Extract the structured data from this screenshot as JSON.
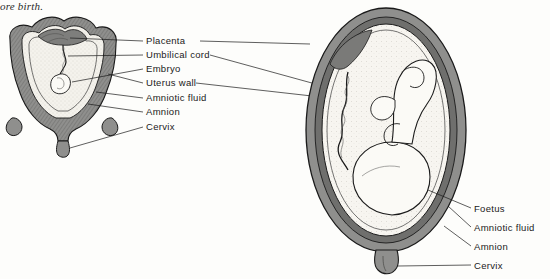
{
  "caption": {
    "text": "ore birth."
  },
  "figure": {
    "left_diagram": {
      "name": "early-pregnancy-uterus",
      "description": "Small cross-section of uterus with embryo"
    },
    "right_diagram": {
      "name": "late-pregnancy-uterus",
      "description": "Large cross-section of uterus with foetus"
    }
  },
  "labels": {
    "left_group": [
      {
        "id": "placenta",
        "text": "Placenta",
        "x": 146,
        "y": 41
      },
      {
        "id": "umbilical-cord",
        "text": "Umbilical cord",
        "x": 146,
        "y": 55
      },
      {
        "id": "embryo",
        "text": "Embryo",
        "x": 146,
        "y": 69
      },
      {
        "id": "uterus-wall",
        "text": "Uterus wall",
        "x": 146,
        "y": 83
      },
      {
        "id": "amniotic-fluid",
        "text": "Amniotic fluid",
        "x": 146,
        "y": 98
      },
      {
        "id": "amnion",
        "text": "Amnion",
        "x": 146,
        "y": 112
      },
      {
        "id": "cervix",
        "text": "Cervix",
        "x": 146,
        "y": 127
      }
    ],
    "right_group": [
      {
        "id": "foetus",
        "text": "Foetus",
        "x": 474,
        "y": 209
      },
      {
        "id": "amniotic-fluid-right",
        "text": "Amniotic fluid",
        "x": 474,
        "y": 228
      },
      {
        "id": "amnion-right",
        "text": "Amnion",
        "x": 474,
        "y": 247
      },
      {
        "id": "cervix-right",
        "text": "Cervix",
        "x": 474,
        "y": 266
      }
    ]
  },
  "colors": {
    "ink": "#1a1a1a",
    "wall_fill": "#8c8c8c",
    "wall_dark": "#6e6e6e",
    "fluid_fill": "#f2f0ea",
    "fetus_fill": "#fbfaf6",
    "paper": "#fdfdfb"
  }
}
